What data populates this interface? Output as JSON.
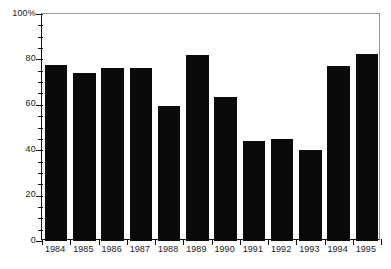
{
  "chart_data": {
    "type": "bar",
    "title": "",
    "subtitle": "",
    "xlabel": "",
    "ylabel": "",
    "categories": [
      "1984",
      "1985",
      "1986",
      "1987",
      "1988",
      "1989",
      "1990",
      "1991",
      "1992",
      "1993",
      "1994",
      "1995"
    ],
    "values": [
      77.5,
      74,
      76,
      76,
      59.5,
      82,
      63.5,
      44,
      45,
      40,
      77,
      82.5
    ],
    "series": [
      {
        "name": "",
        "values": [
          77.5,
          74,
          76,
          76,
          59.5,
          82,
          63.5,
          44,
          45,
          40,
          77,
          82.5
        ]
      }
    ],
    "ylim": [
      0,
      100
    ],
    "y_major_ticks": [
      0,
      20,
      40,
      60,
      80,
      100
    ],
    "y_major_tick_labels": [
      "0",
      "20",
      "40",
      "60",
      "80",
      "100%"
    ],
    "y_minor_tick_interval": 5,
    "grid": false,
    "legend": false,
    "legend_position": "none",
    "bar_color": "#0a0a0a",
    "axis_color": "#111111",
    "frame_color": "#9a9a9a",
    "background_color": "#ffffff"
  }
}
